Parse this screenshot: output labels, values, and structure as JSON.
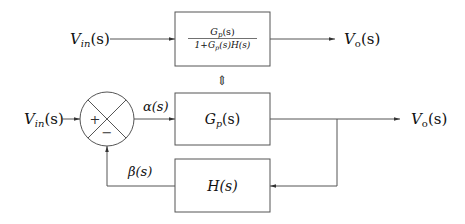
{
  "diagram": {
    "type": "block-diagram",
    "title": "",
    "equivalent_system": {
      "input_label": "V_in(s)",
      "input_main": "V",
      "input_sub": "in",
      "input_arg": "(s)",
      "output_label": "V_o(s)",
      "output_main": "V",
      "output_sub": "o",
      "output_arg": "(s)",
      "block": {
        "numerator": "G_p(s)",
        "num_main": "G",
        "num_sub": "p",
        "num_arg": "(s)",
        "denominator": "1+G_p(s)H(s)",
        "den_prefix": "1+G",
        "den_sub": "p",
        "den_mid": "(s)H(s)"
      }
    },
    "equivalence_symbol": "⇕",
    "feedback_system": {
      "input_label": "V_in(s)",
      "input_main": "V",
      "input_sub": "in",
      "input_arg": "(s)",
      "summing_junction": {
        "plus_sign": "+",
        "minus_sign": "−"
      },
      "error_signal": "α(s)",
      "feedback_signal": "β(s)",
      "forward_block": {
        "label": "G_p(s)",
        "main": "G",
        "sub": "p",
        "arg": "(s)"
      },
      "feedback_block": {
        "label": "H(s)"
      },
      "output_label": "V_o(s)",
      "output_main": "V",
      "output_sub": "o",
      "output_arg": "(s)"
    },
    "colors": {
      "stroke": "#555555",
      "text": "#111111",
      "background": "#ffffff"
    }
  }
}
